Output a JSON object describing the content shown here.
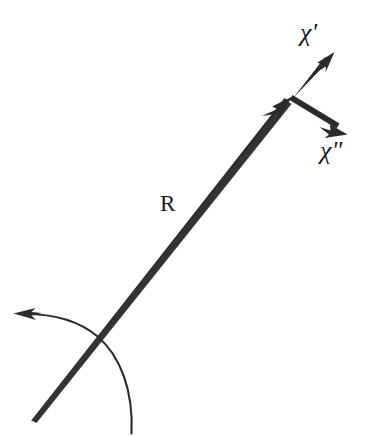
{
  "figure": {
    "type": "vector-diagram",
    "background_color": "#ffffff",
    "ink_color": "#2b2b2b",
    "width": 368,
    "height": 436,
    "labels": {
      "radius_vector": "R",
      "chi_prime": "χ'",
      "chi_double_prime": "χ\""
    },
    "elements": [
      {
        "name": "radius-vector-arrow",
        "label": "R",
        "kind": "thick-tapered-arrow",
        "from": [
          30,
          420
        ],
        "to": [
          293,
          97
        ],
        "arrowhead": "barbed"
      },
      {
        "name": "chi-prime-arrow",
        "label": "χ'",
        "kind": "arrow",
        "from": [
          293,
          97
        ],
        "to": [
          333,
          54
        ],
        "arrowhead": "barbed"
      },
      {
        "name": "chi-double-prime-arrow",
        "label": "χ\"",
        "kind": "arrow",
        "from": [
          293,
          97
        ],
        "to": [
          346,
          134
        ],
        "arrowhead": "barbed"
      },
      {
        "name": "rotation-arc-arrow",
        "label": "",
        "kind": "curved-arrow",
        "from": [
          131,
          433
        ],
        "to": [
          15,
          313
        ],
        "arrowhead": "barbed-thin"
      }
    ]
  }
}
